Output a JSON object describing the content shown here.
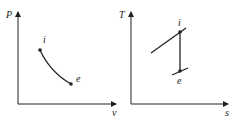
{
  "diagrams": [
    {
      "name": "P-v diagram",
      "y_axis_label": "P",
      "x_axis_label": "v",
      "points": [
        {
          "label": "i"
        },
        {
          "label": "e"
        }
      ],
      "process": "curved expansion from i to e"
    },
    {
      "name": "T-s diagram",
      "y_axis_label": "T",
      "x_axis_label": "s",
      "points": [
        {
          "label": "i"
        },
        {
          "label": "e"
        }
      ],
      "process": "vertical (isentropic) line from i down to e, with constant-pressure lines through each point"
    }
  ],
  "colors": {
    "line": "#222222",
    "background": "#ffffff"
  }
}
